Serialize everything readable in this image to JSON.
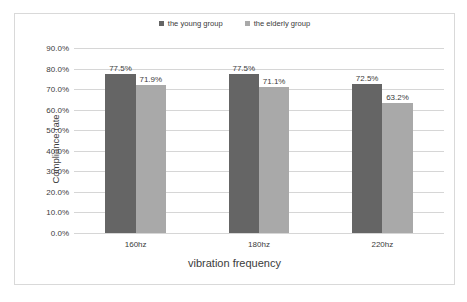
{
  "chart_data": {
    "type": "bar",
    "title": "",
    "xlabel": "vibration frequency",
    "ylabel": "Compliance rate",
    "categories": [
      "160hz",
      "180hz",
      "220hz"
    ],
    "series": [
      {
        "name": "the young group",
        "color": "#656565",
        "values": [
          77.5,
          77.5,
          72.5
        ],
        "labels": [
          "77.5%",
          "77.5%",
          "72.5%"
        ]
      },
      {
        "name": "the elderly group",
        "color": "#a9a9a9",
        "values": [
          71.9,
          71.1,
          63.2
        ],
        "labels": [
          "71.9%",
          "71.1%",
          "63.2%"
        ]
      }
    ],
    "ylim": [
      0,
      90
    ],
    "ytick_values": [
      90,
      80,
      70,
      60,
      50,
      40,
      30,
      20,
      10,
      0
    ],
    "ytick_labels": [
      "90.0%",
      "80.0%",
      "70.0%",
      "60.0%",
      "50.0%",
      "40.0%",
      "30.0%",
      "20.0%",
      "10.0%",
      "0.0%"
    ],
    "grid": true,
    "legend_position": "top-center",
    "frame_color": "#d9d9d9",
    "gridline_color": "#d6d6d6"
  }
}
